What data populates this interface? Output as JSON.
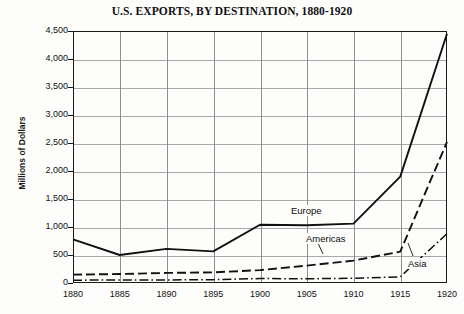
{
  "chart_data": {
    "type": "line",
    "title": "U.S. EXPORTS, BY DESTINATION, 1880-1920",
    "xlabel": "",
    "ylabel": "Millions of Dollars",
    "x": [
      1880,
      1885,
      1890,
      1895,
      1900,
      1905,
      1910,
      1915,
      1920
    ],
    "xtick_labels": [
      "1880",
      "1885",
      "1890",
      "1895",
      "1900",
      "1905",
      "1910",
      "1915",
      "1920"
    ],
    "ytick_labels": [
      "0",
      "500",
      "1,000",
      "1,500",
      "2,000",
      "2,500",
      "3,000",
      "3,500",
      "4,000",
      "4,500"
    ],
    "ytick_values": [
      0,
      500,
      1000,
      1500,
      2000,
      2500,
      3000,
      3500,
      4000,
      4500
    ],
    "ylim": [
      0,
      4500
    ],
    "xlim": [
      1880,
      1920
    ],
    "grid": true,
    "legend": "inline-annotations",
    "series": [
      {
        "name": "Europe",
        "style": "solid",
        "color": "#111111",
        "values": [
          780,
          500,
          610,
          565,
          1040,
          1030,
          1060,
          1900,
          4450
        ]
      },
      {
        "name": "Americas",
        "style": "dashed",
        "color": "#111111",
        "values": [
          150,
          160,
          180,
          190,
          230,
          310,
          400,
          560,
          2520
        ]
      },
      {
        "name": "Asia",
        "style": "dash-dot",
        "color": "#111111",
        "values": [
          50,
          55,
          55,
          60,
          80,
          75,
          85,
          110,
          880
        ]
      }
    ],
    "annotations": [
      {
        "text": "Europe",
        "series": "Europe",
        "leader": true
      },
      {
        "text": "Americas",
        "series": "Americas",
        "leader": true
      },
      {
        "text": "Asia",
        "series": "Asia",
        "leader": true
      }
    ]
  }
}
